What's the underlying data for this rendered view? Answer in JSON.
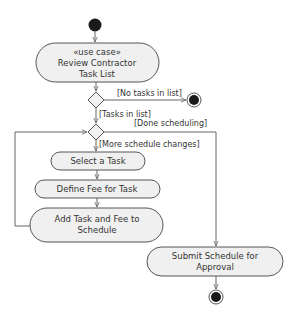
{
  "diagram": {
    "type": "UML activity diagram",
    "nodes": {
      "review": {
        "stereotype": "«use case»",
        "line1": "Review Contractor",
        "line2": "Task List"
      },
      "select": {
        "label": "Select a Task"
      },
      "define": {
        "label": "Define Fee for Task"
      },
      "add": {
        "line1": "Add Task and Fee to",
        "line2": "Schedule"
      },
      "submit": {
        "line1": "Submit Schedule for",
        "line2": "Approval"
      }
    },
    "guards": {
      "no_tasks": "[No tasks in list]",
      "tasks": "[Tasks in list]",
      "done": "[Done scheduling]",
      "more": "[More schedule changes]"
    },
    "colors": {
      "fill": "#f0f0f0",
      "stroke": "#555555",
      "edge": "#666666",
      "text": "#333333",
      "terminal": "#1a1a1a"
    }
  }
}
